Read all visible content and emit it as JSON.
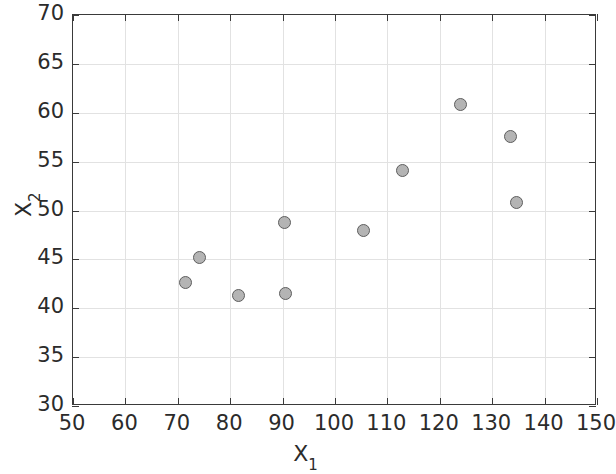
{
  "chart_data": {
    "type": "scatter",
    "title": "",
    "xlabel": "X_1",
    "ylabel": "X_2",
    "xlabel_base": "X",
    "xlabel_sub": "1",
    "ylabel_base": "X",
    "ylabel_sub": "2",
    "xlim": [
      50,
      150
    ],
    "ylim": [
      30,
      70
    ],
    "xticks": [
      50,
      60,
      70,
      80,
      90,
      100,
      110,
      120,
      130,
      140,
      150
    ],
    "yticks": [
      30,
      35,
      40,
      45,
      50,
      55,
      60,
      65,
      70
    ],
    "xticklabels": [
      "50",
      "60",
      "70",
      "80",
      "90",
      "100",
      "110",
      "120",
      "130",
      "140",
      "150"
    ],
    "yticklabels": [
      "30",
      "35",
      "40",
      "45",
      "50",
      "55",
      "60",
      "65",
      "70"
    ],
    "grid": true,
    "legend": null,
    "marker_style": {
      "shape": "circle",
      "fill_color": "#b4b4b4",
      "edge_color": "#5e5e5e",
      "size_px": 13
    },
    "axis_color": "#3a3a3a",
    "grid_color": "#e2e2e2",
    "background_color": "#ffffff",
    "points": [
      {
        "x": 71.5,
        "y": 42.6
      },
      {
        "x": 74.2,
        "y": 45.2
      },
      {
        "x": 81.5,
        "y": 41.3
      },
      {
        "x": 90.3,
        "y": 48.8
      },
      {
        "x": 90.5,
        "y": 41.5
      },
      {
        "x": 105.5,
        "y": 48.0
      },
      {
        "x": 112.8,
        "y": 54.1
      },
      {
        "x": 124.0,
        "y": 60.8
      },
      {
        "x": 133.5,
        "y": 57.6
      },
      {
        "x": 134.6,
        "y": 50.8
      }
    ]
  }
}
